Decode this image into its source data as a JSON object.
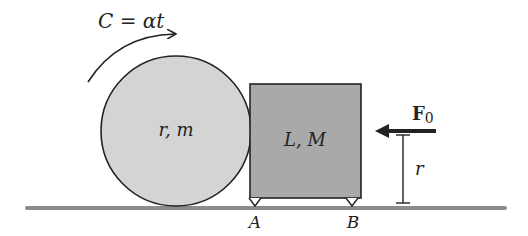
{
  "diagram": {
    "torque_label": "C = αt",
    "cylinder_label": "r, m",
    "block_label": "L, M",
    "force_label": "F",
    "force_subscript": "0",
    "height_label": "r",
    "support_a_label": "A",
    "support_b_label": "B",
    "colors": {
      "cylinder_fill": "#d4d4d4",
      "block_fill": "#a9a9a9",
      "ground": "#8c8c8c",
      "stroke": "#222222"
    }
  }
}
